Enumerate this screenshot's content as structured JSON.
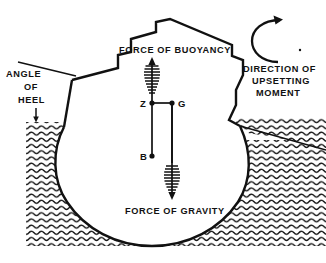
{
  "figure": {
    "background_color": "#ffffff",
    "ink_color": "#111111"
  },
  "labels": {
    "angle_of_heel": [
      "ANGLE",
      "OF",
      "HEEL"
    ],
    "force_of_buoyancy": "FORCE OF BUOYANCY",
    "force_of_gravity": "FORCE OF GRAVITY",
    "direction_of_upsetting_moment": [
      "DIRECTION  OF",
      "UPSETTING",
      "MOMENT"
    ]
  },
  "points": {
    "z": {
      "label": "Z",
      "x": 152,
      "y": 103
    },
    "g": {
      "label": "G",
      "x": 172,
      "y": 103
    },
    "b": {
      "label": "B",
      "x": 152,
      "y": 156
    }
  },
  "vectors": {
    "buoyancy": {
      "direction": "up",
      "from_point": "B",
      "through_point": "Z",
      "arrow_style": "feathered"
    },
    "gravity": {
      "direction": "down",
      "from_point": "G",
      "arrow_style": "feathered"
    }
  },
  "moment": {
    "sense": "counter-clockwise-open-right",
    "glyph": "curved-arc-arrow"
  },
  "water": {
    "hatch_style": "wavy-horizontal-lines",
    "left_waterline_y": 122,
    "right_waterline_tilt": "descending-to-right"
  }
}
